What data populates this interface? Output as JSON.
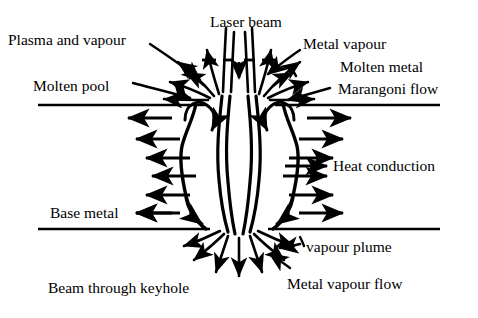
{
  "figure": {
    "kind": "schematic-diagram",
    "background_color": "#ffffff",
    "stroke_color": "#000000",
    "text_color": "#000000"
  },
  "labels": {
    "plasma_and_vapour": "Plasma and vapour",
    "laser_beam": "Laser beam",
    "metal_vapour": "Metal vapour",
    "molten_pool": "Molten pool",
    "molten_metal": "Molten metal",
    "marangoni_flow": "Marangoni flow",
    "heat_conduction": "Heat conduction",
    "base_metal": "Base metal",
    "vapour_plume": "vapour plume",
    "beam_through_keyhole": "Beam through keyhole",
    "metal_vapour_flow": "Metal vapour flow"
  },
  "annotations": [
    {
      "id": "plasma-and-vapour",
      "text": "Plasma and vapour",
      "x": 8,
      "y": 32,
      "leader": true,
      "leader_to": "upper-left plume"
    },
    {
      "id": "laser-beam",
      "text": "Laser beam",
      "x": 210,
      "y": 14,
      "leader": false,
      "leader_to": "beam axis"
    },
    {
      "id": "metal-vapour",
      "text": "Metal vapour",
      "x": 303,
      "y": 36,
      "leader": true,
      "leader_to": "upper-right plume"
    },
    {
      "id": "molten-pool",
      "text": "Molten pool",
      "x": 33,
      "y": 78,
      "leader": true,
      "leader_to": "left pool surface"
    },
    {
      "id": "molten-metal",
      "text": "Molten metal",
      "x": 340,
      "y": 59,
      "leader": true,
      "leader_to": "right pool"
    },
    {
      "id": "marangoni-flow",
      "text": "Marangoni flow",
      "x": 338,
      "y": 81,
      "leader": true,
      "leader_to": "right pool surface vortex"
    },
    {
      "id": "heat-conduction",
      "text": "Heat conduction",
      "x": 333,
      "y": 166,
      "leader": false,
      "leader_to": "right arrow row"
    },
    {
      "id": "base-metal",
      "text": "Base metal",
      "x": 50,
      "y": 206,
      "leader": false,
      "leader_to": "bottom surface line"
    },
    {
      "id": "vapour-plume",
      "text": "vapour plume",
      "x": 303,
      "y": 240,
      "leader": true,
      "leader_to": "lower plume"
    },
    {
      "id": "beam-through-keyhole",
      "text": "Beam through keyhole",
      "x": 48,
      "y": 281,
      "leader": false,
      "leader_to": "keyhole exit"
    },
    {
      "id": "metal-vapour-flow",
      "text": "Metal vapour flow",
      "x": 287,
      "y": 277,
      "leader": true,
      "leader_to": "lower outflow"
    }
  ],
  "geometry": {
    "top_surface_line": {
      "y": 105,
      "x_left": 38,
      "x_right": 440
    },
    "bottom_surface_line": {
      "y": 229,
      "x_left": 38,
      "x_right": 440
    },
    "keyhole_axis_x": 239,
    "plate_thickness_px": 124
  },
  "heat_conduction_arrows": {
    "direction_left": "left",
    "direction_right": "right",
    "left_rows_y": [
      118,
      139,
      158,
      176,
      195,
      213
    ],
    "right_rows_y": [
      118,
      139,
      158,
      176,
      195,
      213
    ],
    "count_per_side": 6
  },
  "flow_features": [
    {
      "name": "laser-beam-rays",
      "location": "top-center",
      "direction": "downward"
    },
    {
      "name": "beam-centre-arrow",
      "location": "top-center",
      "direction": "downward"
    },
    {
      "name": "upper-plume-fan",
      "location": "above top surface",
      "direction": "up-and-outward"
    },
    {
      "name": "marangoni-vortex-left",
      "location": "left pool",
      "direction": "clockwise"
    },
    {
      "name": "marangoni-vortex-right",
      "location": "right pool",
      "direction": "counter-clockwise"
    },
    {
      "name": "keyhole-wall-left",
      "location": "center",
      "direction": "n/a"
    },
    {
      "name": "keyhole-wall-right",
      "location": "center",
      "direction": "n/a"
    },
    {
      "name": "lower-plume-fan",
      "location": "below bottom surface",
      "direction": "down-and-outward"
    }
  ]
}
